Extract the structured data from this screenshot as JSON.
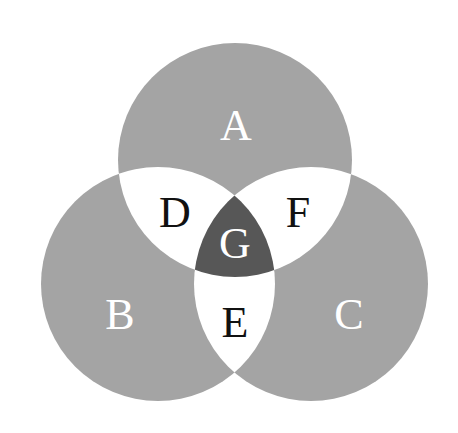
{
  "diagram": {
    "type": "venn",
    "colors": {
      "circle": "#a4a4a4",
      "pairwise": "#ffffff",
      "triple": "#575757",
      "light_text": "#ffffff",
      "dark_text": "#111111"
    },
    "circles": [
      {
        "id": "A",
        "label": "A",
        "cx": 235,
        "cy": 160,
        "r": 117
      },
      {
        "id": "B",
        "label": "B",
        "cx": 158,
        "cy": 284,
        "r": 117
      },
      {
        "id": "C",
        "label": "C",
        "cx": 311,
        "cy": 284,
        "r": 117
      }
    ],
    "regions": {
      "A": {
        "label": "A",
        "x": 236,
        "y": 125,
        "desc": "A only"
      },
      "B": {
        "label": "B",
        "x": 120,
        "y": 314,
        "desc": "B only"
      },
      "C": {
        "label": "C",
        "x": 349,
        "y": 314,
        "desc": "C only"
      },
      "D": {
        "label": "D",
        "x": 175,
        "y": 212,
        "desc": "A and B"
      },
      "E": {
        "label": "E",
        "x": 235,
        "y": 322,
        "desc": "B and C"
      },
      "F": {
        "label": "F",
        "x": 298,
        "y": 212,
        "desc": "A and C"
      },
      "G": {
        "label": "G",
        "x": 235,
        "y": 243,
        "desc": "A, B and C"
      }
    }
  }
}
